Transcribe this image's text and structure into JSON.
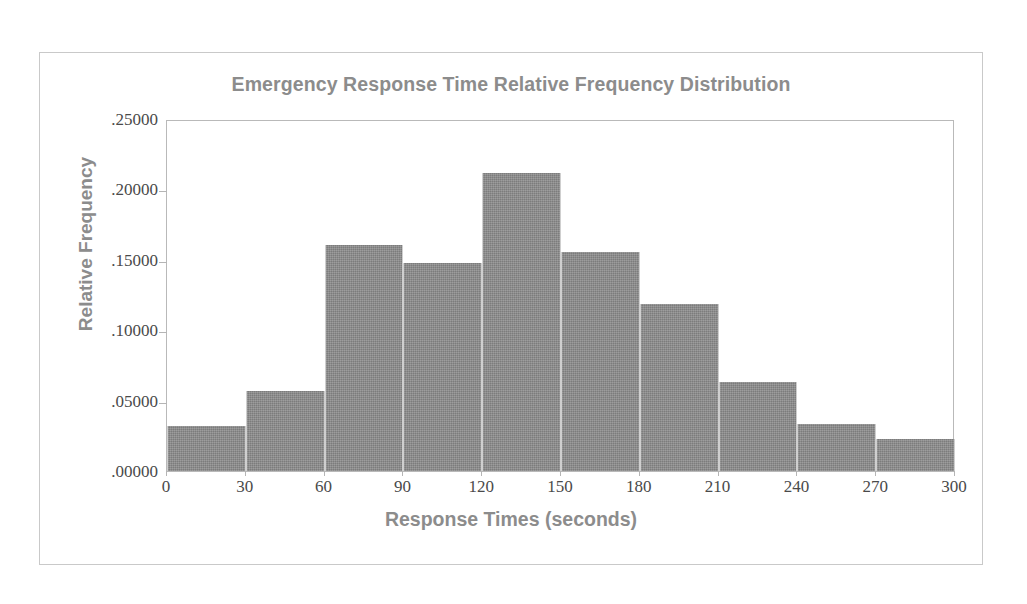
{
  "chart_data": {
    "type": "bar",
    "title": "Emergency Response Time Relative Frequency Distribution",
    "xlabel": "Response Times (seconds)",
    "ylabel": "Relative Frequency",
    "categories": [
      "0-30",
      "30-60",
      "60-90",
      "90-120",
      "120-150",
      "150-180",
      "180-210",
      "210-240",
      "240-270",
      "270-300"
    ],
    "bin_edges": [
      0,
      30,
      60,
      90,
      120,
      150,
      180,
      210,
      240,
      270,
      300
    ],
    "values": [
      0.032,
      0.057,
      0.1605,
      0.148,
      0.2115,
      0.1555,
      0.1185,
      0.0635,
      0.0335,
      0.0225
    ],
    "xlim": [
      0,
      300
    ],
    "ylim": [
      0,
      0.25
    ],
    "xticks": [
      0,
      30,
      60,
      90,
      120,
      150,
      180,
      210,
      240,
      270,
      300
    ],
    "xtick_labels": [
      "0",
      "30",
      "60",
      "90",
      "120",
      "150",
      "180",
      "210",
      "240",
      "270",
      "300"
    ],
    "yticks": [
      0.0,
      0.05,
      0.1,
      0.15,
      0.2,
      0.25
    ],
    "ytick_labels": [
      ".00000",
      ".05000",
      ".10000",
      ".15000",
      ".20000",
      ".25000"
    ],
    "grid": false,
    "legend": false,
    "bar_color": "#8b8b8b",
    "text_color": "#8c8c8c",
    "axis_label_color": "#4a4a4a",
    "plot_border_color": "#b9b9b9",
    "page_border_color": "#c9c9c9",
    "background_color": "#ffffff"
  }
}
